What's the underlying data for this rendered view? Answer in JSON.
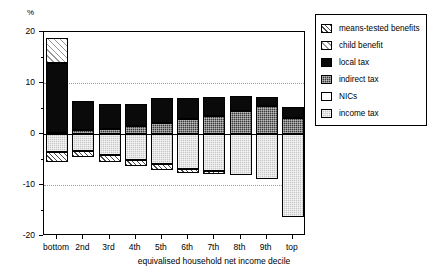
{
  "chart_data": {
    "type": "bar",
    "subtype": "stacked-diverging",
    "title": "",
    "xlabel": "equivalised household net income decile",
    "ylabel": "%",
    "ylim": [
      -20,
      20
    ],
    "yticks": [
      20,
      10,
      0,
      -10,
      -20
    ],
    "yminorticks": [
      15,
      5,
      -5,
      -15
    ],
    "grid": "horizontal-dotted-at-10-and-minus-10",
    "legend_position": "right",
    "categories": [
      "bottom",
      "2nd",
      "3rd",
      "4th",
      "5th",
      "6th",
      "7th",
      "8th",
      "9th",
      "top"
    ],
    "series": [
      {
        "name": "means-tested benefits",
        "pattern": "diagonal-hatch-dark",
        "values": [
          4.8,
          1.6,
          1.1,
          0.8,
          0.7,
          0.5,
          0.4,
          0.3,
          0.2,
          0.0
        ]
      },
      {
        "name": "child benefit",
        "pattern": "diagonal-hatch-light",
        "values": [
          18.8,
          6.4,
          5.9,
          5.8,
          7.1,
          7.0,
          7.2,
          7.4,
          7.3,
          5.3
        ]
      },
      {
        "name": "local tax",
        "pattern": "solid-black",
        "values": [
          14.0,
          5.2,
          4.6,
          4.4,
          5.2,
          4.9,
          4.4,
          3.9,
          3.1,
          0.0
        ]
      },
      {
        "name": "indirect tax",
        "pattern": "dark-stipple",
        "values": [
          0.2,
          0.7,
          1.0,
          1.5,
          2.1,
          2.9,
          3.6,
          4.5,
          5.4,
          3.2
        ]
      },
      {
        "name": "NICs",
        "pattern": "white",
        "values": [
          -1.5,
          -2.5,
          -3.0,
          -3.3,
          -3.5,
          -3.7,
          -3.8,
          -3.9,
          -4.0,
          -3.0
        ]
      },
      {
        "name": "income tax",
        "pattern": "light-stipple",
        "values": [
          -3.6,
          -4.4,
          -5.1,
          -5.6,
          -6.6,
          -7.0,
          -7.6,
          -8.2,
          -8.9,
          -16.2
        ]
      }
    ],
    "bars": [
      {
        "category": "bottom",
        "positive": [
          {
            "series": "child benefit",
            "from": 14.0,
            "to": 18.8
          },
          {
            "series": "local tax",
            "from": 0.2,
            "to": 14.0
          },
          {
            "series": "indirect tax",
            "from": 0.0,
            "to": 0.2
          }
        ],
        "negative": [
          {
            "series": "income tax",
            "from": -3.6,
            "to": 0.0
          },
          {
            "series": "means-tested benefits",
            "from": -5.4,
            "to": -3.6
          }
        ]
      },
      {
        "category": "2nd",
        "positive": [
          {
            "series": "local tax",
            "from": 0.7,
            "to": 6.4
          },
          {
            "series": "indirect tax",
            "from": 0.0,
            "to": 0.7
          }
        ],
        "negative": [
          {
            "series": "income tax",
            "from": -3.3,
            "to": 0.0
          },
          {
            "series": "means-tested benefits",
            "from": -4.6,
            "to": -3.3
          }
        ]
      },
      {
        "category": "3rd",
        "positive": [
          {
            "series": "local tax",
            "from": 1.0,
            "to": 5.9
          },
          {
            "series": "indirect tax",
            "from": 0.0,
            "to": 1.0
          }
        ],
        "negative": [
          {
            "series": "income tax",
            "from": -4.2,
            "to": 0.0
          },
          {
            "series": "means-tested benefits",
            "from": -5.4,
            "to": -4.2
          }
        ]
      },
      {
        "category": "4th",
        "positive": [
          {
            "series": "local tax",
            "from": 1.5,
            "to": 5.8
          },
          {
            "series": "indirect tax",
            "from": 0.0,
            "to": 1.5
          }
        ],
        "negative": [
          {
            "series": "income tax",
            "from": -5.0,
            "to": 0.0
          },
          {
            "series": "means-tested benefits",
            "from": -6.3,
            "to": -5.0
          }
        ]
      },
      {
        "category": "5th",
        "positive": [
          {
            "series": "local tax",
            "from": 2.1,
            "to": 7.1
          },
          {
            "series": "indirect tax",
            "from": 0.0,
            "to": 2.1
          }
        ],
        "negative": [
          {
            "series": "income tax",
            "from": -5.9,
            "to": 0.0
          },
          {
            "series": "means-tested benefits",
            "from": -7.0,
            "to": -5.9
          }
        ]
      },
      {
        "category": "6th",
        "positive": [
          {
            "series": "local tax",
            "from": 2.9,
            "to": 7.0
          },
          {
            "series": "indirect tax",
            "from": 0.0,
            "to": 2.9
          }
        ],
        "negative": [
          {
            "series": "income tax",
            "from": -6.8,
            "to": 0.0
          },
          {
            "series": "means-tested benefits",
            "from": -7.6,
            "to": -6.8
          }
        ]
      },
      {
        "category": "7th",
        "positive": [
          {
            "series": "local tax",
            "from": 3.6,
            "to": 7.2
          },
          {
            "series": "indirect tax",
            "from": 0.0,
            "to": 3.6
          }
        ],
        "negative": [
          {
            "series": "income tax",
            "from": -7.3,
            "to": 0.0
          },
          {
            "series": "means-tested benefits",
            "from": -7.9,
            "to": -7.3
          }
        ]
      },
      {
        "category": "8th",
        "positive": [
          {
            "series": "local tax",
            "from": 4.5,
            "to": 7.4
          },
          {
            "series": "indirect tax",
            "from": 0.0,
            "to": 4.5
          }
        ],
        "negative": [
          {
            "series": "income tax",
            "from": -8.1,
            "to": 0.0
          }
        ]
      },
      {
        "category": "9th",
        "positive": [
          {
            "series": "local tax",
            "from": 5.4,
            "to": 7.3
          },
          {
            "series": "indirect tax",
            "from": 0.0,
            "to": 5.4
          }
        ],
        "negative": [
          {
            "series": "income tax",
            "from": -8.9,
            "to": 0.0
          }
        ]
      },
      {
        "category": "top",
        "positive": [
          {
            "series": "local tax",
            "from": 3.2,
            "to": 5.3
          },
          {
            "series": "indirect tax",
            "from": 0.0,
            "to": 3.2
          }
        ],
        "negative": [
          {
            "series": "income tax",
            "from": -16.2,
            "to": 0.0
          }
        ]
      }
    ]
  },
  "axis": {
    "y_unit_label": "%",
    "y_tick_labels": [
      "20",
      "10",
      "0",
      "-10",
      "-20"
    ],
    "x_title": "equivalised household net income decile",
    "x_tick_labels": [
      "bottom",
      "2nd",
      "3rd",
      "4th",
      "5th",
      "6th",
      "7th",
      "8th",
      "9th",
      "top"
    ]
  },
  "legend": {
    "items": [
      {
        "label": "means-tested benefits",
        "fill": "f-means"
      },
      {
        "label": "child benefit",
        "fill": "f-child"
      },
      {
        "label": "local tax",
        "fill": "f-local"
      },
      {
        "label": "indirect tax",
        "fill": "f-indirect"
      },
      {
        "label": "NICs",
        "fill": "f-nics"
      },
      {
        "label": "income tax",
        "fill": "f-income"
      }
    ]
  },
  "colors": {
    "axis": "#000000",
    "grid": "#999999",
    "local_tax": "#0a0a0a",
    "indirect_tax": "#3a3a3a",
    "nics": "#ffffff",
    "income_tax": "#c8c8c8"
  }
}
